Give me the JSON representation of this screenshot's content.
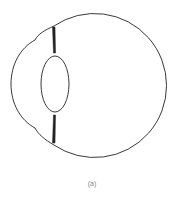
{
  "diagram": {
    "parts": [
      "eyeball",
      "cornea",
      "lens",
      "iris"
    ],
    "caption": "(a)",
    "stroke_color": "#222222"
  }
}
